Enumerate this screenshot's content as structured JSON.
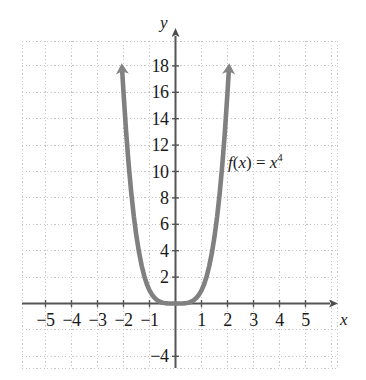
{
  "chart_data": {
    "type": "line",
    "title": "",
    "subtitle": "",
    "xlabel": "x",
    "ylabel": "y",
    "function_label": "f(x) = x^4",
    "function_label_parts": {
      "fname": "f",
      "open": "(",
      "arg": "x",
      "close": ")",
      "equals": " = ",
      "base": "x",
      "exponent": "4"
    },
    "series": [
      {
        "name": "f(x) = x^4",
        "color": "#808080",
        "points": [
          {
            "x": -2.05,
            "y": 17.6
          },
          {
            "x": -2.0,
            "y": 16.0
          },
          {
            "x": -1.9,
            "y": 13.03
          },
          {
            "x": -1.8,
            "y": 10.49
          },
          {
            "x": -1.7,
            "y": 8.35
          },
          {
            "x": -1.6,
            "y": 6.55
          },
          {
            "x": -1.5,
            "y": 5.06
          },
          {
            "x": -1.4,
            "y": 3.84
          },
          {
            "x": -1.3,
            "y": 2.86
          },
          {
            "x": -1.2,
            "y": 2.07
          },
          {
            "x": -1.1,
            "y": 1.46
          },
          {
            "x": -1.0,
            "y": 1.0
          },
          {
            "x": -0.9,
            "y": 0.66
          },
          {
            "x": -0.8,
            "y": 0.41
          },
          {
            "x": -0.7,
            "y": 0.24
          },
          {
            "x": -0.6,
            "y": 0.13
          },
          {
            "x": -0.5,
            "y": 0.06
          },
          {
            "x": -0.4,
            "y": 0.03
          },
          {
            "x": -0.3,
            "y": 0.01
          },
          {
            "x": -0.2,
            "y": 0.0
          },
          {
            "x": -0.1,
            "y": 0.0
          },
          {
            "x": 0.0,
            "y": 0.0
          },
          {
            "x": 0.1,
            "y": 0.0
          },
          {
            "x": 0.2,
            "y": 0.0
          },
          {
            "x": 0.3,
            "y": 0.01
          },
          {
            "x": 0.4,
            "y": 0.03
          },
          {
            "x": 0.5,
            "y": 0.06
          },
          {
            "x": 0.6,
            "y": 0.13
          },
          {
            "x": 0.7,
            "y": 0.24
          },
          {
            "x": 0.8,
            "y": 0.41
          },
          {
            "x": 0.9,
            "y": 0.66
          },
          {
            "x": 1.0,
            "y": 1.0
          },
          {
            "x": 1.1,
            "y": 1.46
          },
          {
            "x": 1.2,
            "y": 2.07
          },
          {
            "x": 1.3,
            "y": 2.86
          },
          {
            "x": 1.4,
            "y": 3.84
          },
          {
            "x": 1.5,
            "y": 5.06
          },
          {
            "x": 1.6,
            "y": 6.55
          },
          {
            "x": 1.7,
            "y": 8.35
          },
          {
            "x": 1.8,
            "y": 10.49
          },
          {
            "x": 1.9,
            "y": 13.03
          },
          {
            "x": 2.0,
            "y": 16.0
          },
          {
            "x": 2.05,
            "y": 17.6
          }
        ]
      }
    ],
    "xlim": [
      -6.0,
      6.2
    ],
    "ylim": [
      -5.0,
      20.5
    ],
    "x_ticks": [
      -5,
      -4,
      -3,
      -2,
      -1,
      1,
      2,
      3,
      4,
      5
    ],
    "x_tick_labels": [
      "−5",
      "−4",
      "−3",
      "−2",
      "−1",
      "1",
      "2",
      "3",
      "4",
      "5"
    ],
    "y_ticks": [
      -4,
      2,
      4,
      6,
      8,
      10,
      12,
      14,
      16,
      18
    ],
    "y_tick_labels": [
      "−4",
      "2",
      "4",
      "6",
      "8",
      "10",
      "12",
      "14",
      "16",
      "18"
    ],
    "grid": true,
    "grid_style": "dotted",
    "grid_color": "#c8c8c8",
    "axis_color": "#595959",
    "axis_arrows": [
      "x-positive",
      "y-positive"
    ],
    "curve_arrows": [
      "left-branch-up",
      "right-branch-up"
    ],
    "legend": "none",
    "background": "#ffffff"
  },
  "axes": {
    "x_name": "x",
    "y_name": "y"
  }
}
